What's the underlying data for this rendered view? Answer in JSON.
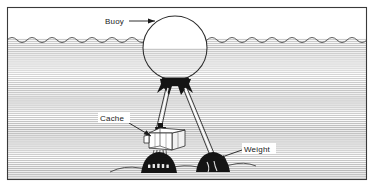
{
  "figure": {
    "frame": {
      "border_color": "#3a3a3a",
      "background_color": "#ffffff"
    },
    "scene": {
      "water_surface_label": "water-surface",
      "water_hatch_color": "#bdbdbd",
      "water_line_color": "#4a4a4a",
      "seafloor_line_color": "#3d3d3d",
      "ink_color": "#1a1a1a",
      "weight_fill": "#141414",
      "cache_fill": "#ffffff",
      "buoy_fill": "#ffffff"
    },
    "labels": [
      {
        "id": "buoy",
        "text": "Buoy",
        "text_x": 105,
        "text_y": 24,
        "leader": "M 127 21 L 155 21",
        "arrow": "M 155 21 L 148 18.4 L 148 23.6 Z"
      },
      {
        "id": "cache",
        "text": "Cache",
        "text_x": 100,
        "text_y": 121,
        "leader": "M 129 123 L 151 136",
        "arrow": "M 151 136 L 143.6 134.3 L 146.4 130.2 Z"
      },
      {
        "id": "weight",
        "text": "Weight",
        "text_x": 244,
        "text_y": 152,
        "leader": "M 242 150 L 219 158",
        "arrow": "M 219 158 L 226.3 159.9 L 223.6 155.3 Z"
      }
    ],
    "components": {
      "buoy": {
        "name": "buoy-sphere",
        "center_x": 175,
        "center_y": 48,
        "radius": 32
      },
      "bridle": {
        "name": "buoy-bridle-harness"
      },
      "mooring_lines": {
        "name": "mooring-lines",
        "count": 2
      },
      "cache": {
        "name": "cache-crate"
      },
      "weights": {
        "name": "ballast-weights",
        "count": 2
      }
    }
  }
}
